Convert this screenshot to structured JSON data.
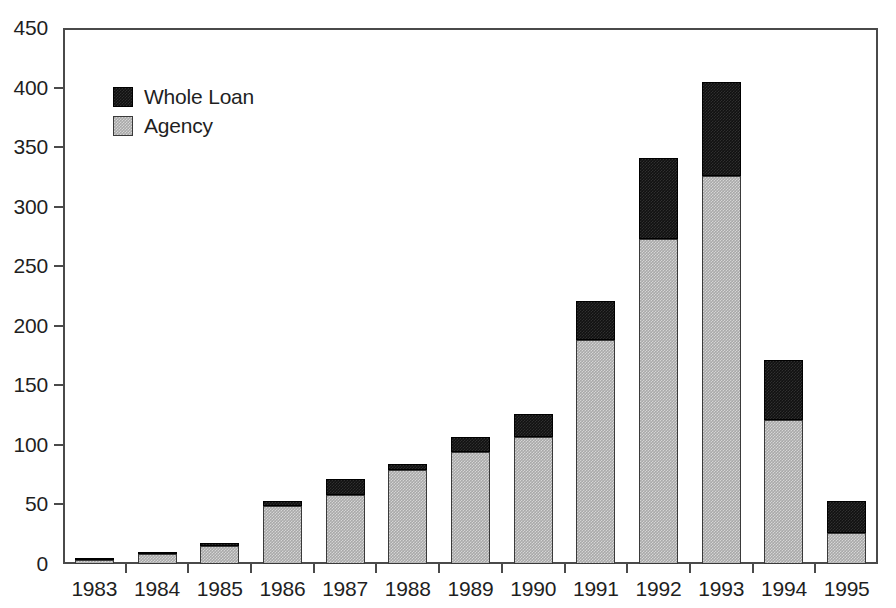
{
  "chart_data": {
    "type": "bar",
    "subtype": "stacked-vertical",
    "title": "",
    "subtitle": "",
    "xlabel": "",
    "ylabel": "",
    "categories": [
      "1983",
      "1984",
      "1985",
      "1986",
      "1987",
      "1988",
      "1989",
      "1990",
      "1991",
      "1992",
      "1993",
      "1994",
      "1995"
    ],
    "series": [
      {
        "name": "Agency",
        "color": "#a9a9a9",
        "values": [
          3,
          8,
          15,
          49,
          58,
          79,
          94,
          107,
          188,
          273,
          326,
          121,
          26
        ]
      },
      {
        "name": "Whole Loan",
        "color": "#111111",
        "values": [
          1,
          2,
          3,
          4,
          13,
          5,
          13,
          19,
          33,
          68,
          79,
          50,
          27
        ]
      }
    ],
    "stack_order": [
      "Agency",
      "Whole Loan"
    ],
    "totals": [
      4,
      10,
      18,
      53,
      71,
      84,
      107,
      126,
      221,
      341,
      405,
      171,
      53
    ],
    "ylim": [
      0,
      450
    ],
    "yticks": [
      0,
      50,
      100,
      150,
      200,
      250,
      300,
      350,
      400,
      450
    ],
    "ytick_labels": [
      "0",
      "50",
      "100",
      "150",
      "200",
      "250",
      "300",
      "350",
      "400",
      "450"
    ],
    "grid": false,
    "legend_position": "top-left",
    "legend_entries": [
      "Whole Loan",
      "Agency"
    ],
    "frame": "box"
  },
  "legend": {
    "items": [
      {
        "label": "Whole Loan",
        "swatch": "whole"
      },
      {
        "label": "Agency",
        "swatch": "agency"
      }
    ]
  }
}
